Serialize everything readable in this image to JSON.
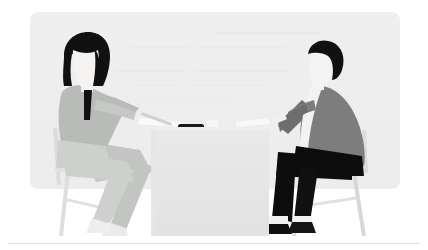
{
  "illustration": {
    "title": "Two people sitting at a table in a meeting",
    "alt_text": "Flat illustration of a woman with long dark hair on the left and a man with dark hair on the right, seated on chairs facing each other across a light gray table with a pen, a phone and papers on it.",
    "style": "flat-vector-illustration",
    "canvas": {
      "width": 428,
      "height": 250
    }
  },
  "colors": {
    "page_background": "#ffffff",
    "panel_background": "#eeeeee",
    "panel_background_alt": "#ededed",
    "table_top": "#efefef",
    "table_body": "#e4e4e4",
    "table_body_shade": "#e0e0e0",
    "hair_dark": "#111111",
    "skin_light": "#f4f3f1",
    "woman_top": "#b9bbb9",
    "woman_top_light": "#c6c8c6",
    "woman_pants": "#cdd0cd",
    "woman_pants_dark": "#bcbfbc",
    "woman_shoe": "#e9eae9",
    "man_jacket": "#7d7d7d",
    "man_jacket_dark": "#6e6e6e",
    "man_shirt": "#f2f2f2",
    "man_pants": "#0d0d0d",
    "man_shoe": "#111111",
    "man_sock": "#f2f2f2",
    "chair_frame": "#dadada",
    "chair_frame_dark": "#cfcfcf",
    "chair_seat": "#e3e3e3",
    "phone": "#1a1a1a",
    "pen": "#cfcfcf",
    "paper": "#fbfbfb",
    "divider": "#e2e2e2"
  },
  "panel": {
    "name": "background-panel",
    "x": 30,
    "y": 12,
    "width": 370,
    "height": 177,
    "corner_radius": 8
  },
  "divider": {
    "name": "bottom-divider",
    "y": 243,
    "x_start": 8,
    "x_end": 420,
    "thickness": 1
  },
  "figures": [
    {
      "id": "woman",
      "label": "Woman seated on left",
      "position": "left",
      "hair": "long dark hair",
      "top_color": "#b9bbb9",
      "pants_color": "#cdd0cd"
    },
    {
      "id": "man",
      "label": "Man seated on right",
      "position": "right",
      "hair": "short dark hair",
      "jacket_color": "#7d7d7d",
      "pants_color": "#0d0d0d"
    }
  ],
  "table_objects": [
    {
      "id": "pen",
      "label": "Pen on table",
      "color": "#cfcfcf"
    },
    {
      "id": "phone",
      "label": "Phone on table",
      "color": "#1a1a1a"
    },
    {
      "id": "papers",
      "label": "Papers on table",
      "color": "#fbfbfb"
    },
    {
      "id": "cup",
      "label": "Cup on table",
      "color": "#f6f6f6"
    }
  ],
  "furniture": [
    {
      "id": "table",
      "label": "Meeting table"
    },
    {
      "id": "chair-left",
      "label": "Chair under the woman"
    },
    {
      "id": "chair-right",
      "label": "Chair under the man"
    }
  ]
}
